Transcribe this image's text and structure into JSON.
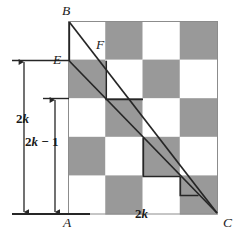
{
  "figure": {
    "colors": {
      "shaded_cell": "#999999",
      "light_cell": "#ffffff",
      "line": "#262626",
      "grid_line": "#8c8c8c",
      "text": "#1a1a1a"
    },
    "board": {
      "columns": 4,
      "rows": 5,
      "origin_x": 68,
      "origin_y": 21,
      "cell_width": 37.25,
      "cell_height": 38.6,
      "pattern": [
        [
          "light",
          "shaded",
          "light",
          "shaded"
        ],
        [
          "shaded",
          "light",
          "shaded",
          "light"
        ],
        [
          "light",
          "shaded",
          "light",
          "shaded"
        ],
        [
          "shaded",
          "light",
          "shaded",
          "light"
        ],
        [
          "light",
          "shaded",
          "light",
          "shaded"
        ]
      ]
    },
    "vertices": [
      {
        "name": "B",
        "label": "B",
        "x": 62,
        "y": 4,
        "anchor": "top-left-corner"
      },
      {
        "name": "E",
        "label": "E",
        "x": 53,
        "y": 53,
        "anchor": "left-edge-point"
      },
      {
        "name": "F",
        "label": "F",
        "x": 96,
        "y": 38,
        "anchor": "interior-point"
      },
      {
        "name": "A",
        "label": "A",
        "x": 63,
        "y": 216,
        "anchor": "bottom-left-corner"
      },
      {
        "name": "C",
        "label": "C",
        "x": 223,
        "y": 216,
        "anchor": "bottom-right-corner"
      }
    ],
    "dimensions": [
      {
        "name": "outer-height",
        "text_parts": {
          "num": "2",
          "var": "k"
        },
        "label": "2k",
        "label_x": 16,
        "label_y": 123,
        "arrow_x": 24,
        "arrow_top": 61,
        "arrow_bottom": 213,
        "tick_top_x1": 12,
        "tick_top_x2": 68,
        "tick_bottom_x1": 12,
        "tick_bottom_x2": 82
      },
      {
        "name": "inner-height",
        "text_parts": {
          "num": "2",
          "var": "k",
          "op": " − ",
          "num2": "1"
        },
        "label": "2k − 1",
        "label_x": 25,
        "label_y": 146,
        "arrow_x": 55,
        "arrow_top": 98,
        "arrow_bottom": 213,
        "tick_top_x1": 43,
        "tick_top_x2": 68,
        "tick_bottom_x1": 12,
        "tick_bottom_x2": 82
      },
      {
        "name": "base-width",
        "text_parts": {
          "num": "2",
          "var": "k"
        },
        "label": "2k",
        "label_x": 135,
        "label_y": 218
      }
    ],
    "lines": [
      {
        "name": "segment-BC",
        "from": "B",
        "to": "C",
        "x1": 69,
        "y1": 22,
        "x2": 217,
        "y2": 213
      },
      {
        "name": "segment-EC",
        "from": "E",
        "to": "C",
        "x1": 69,
        "y1": 61,
        "x2": 217,
        "y2": 213
      },
      {
        "name": "segment-BE",
        "from": "B",
        "to": "E",
        "x1": 69,
        "y1": 22,
        "x2": 69,
        "y2": 61
      },
      {
        "name": "staircase-path",
        "description": "step polyline from E down-right following cell boundaries to C"
      }
    ],
    "axis_lines": [
      {
        "name": "baseline-A",
        "x1": 12,
        "y1": 214,
        "x2": 90,
        "y2": 214
      },
      {
        "name": "tick-E-level",
        "x1": 12,
        "y1": 60,
        "x2": 68,
        "y2": 60
      },
      {
        "name": "tick-inner-top",
        "x1": 43,
        "y1": 98,
        "x2": 68,
        "y2": 98
      }
    ]
  }
}
